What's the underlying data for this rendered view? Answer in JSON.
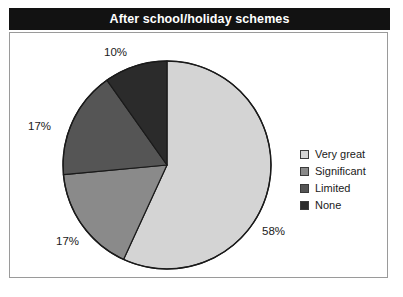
{
  "title": "After school/holiday schemes",
  "chart_data": {
    "type": "pie",
    "title": "After school/holiday schemes",
    "xlabel": "",
    "ylabel": "",
    "legend_position": "right",
    "grid": false,
    "start_angle_deg": 0,
    "direction": "clockwise",
    "categories": [
      "Very great",
      "Significant",
      "Limited",
      "None"
    ],
    "values": [
      58,
      17,
      17,
      10
    ],
    "value_labels": [
      "58%",
      "17%",
      "17%",
      "10%"
    ],
    "unit": "%",
    "colors": [
      "#d4d4d4",
      "#8a8a8a",
      "#555555",
      "#2b2b2b"
    ],
    "slice_outline_color": "#1a1a1a",
    "slices": [
      {
        "label": "Very great",
        "value": 58,
        "display": "58%",
        "color": "#d4d4d4"
      },
      {
        "label": "Significant",
        "value": 17,
        "display": "17%",
        "color": "#8a8a8a"
      },
      {
        "label": "Limited",
        "value": 17,
        "display": "17%",
        "color": "#555555"
      },
      {
        "label": "None",
        "value": 10,
        "display": "10%",
        "color": "#2b2b2b"
      }
    ]
  },
  "labels": {
    "very_great": "58%",
    "significant": "17%",
    "limited": "17%",
    "none": "10%"
  },
  "legend": {
    "items": [
      {
        "label": "Very great",
        "color": "#d4d4d4"
      },
      {
        "label": "Significant",
        "color": "#8a8a8a"
      },
      {
        "label": "Limited",
        "color": "#555555"
      },
      {
        "label": "None",
        "color": "#2b2b2b"
      }
    ]
  },
  "theme": {
    "title_bar_background": "#121212",
    "title_text_color": "#ffffff",
    "frame_border_color": "#9a9a9a",
    "background": "#ffffff",
    "text_color": "#1a1a1a"
  }
}
